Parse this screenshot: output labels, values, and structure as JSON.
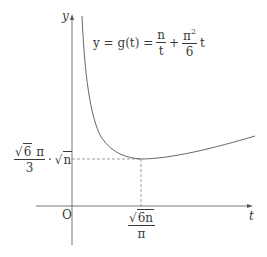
{
  "diagram": {
    "type": "function-graph",
    "axes": {
      "x_label": "t",
      "y_label": "y",
      "origin_label": "O"
    },
    "formula": {
      "lhs": "y = g(t) =",
      "term1_num": "n",
      "term1_den": "t",
      "plus": "+",
      "term2_num": "π",
      "term2_num_exp": "2",
      "term2_den": "6",
      "term2_var": "t"
    },
    "minimum_point": {
      "x_label_sqrt": "6n",
      "x_label_den": "π",
      "y_label_coef_sqrt": "6",
      "y_label_coef_pi": "π",
      "y_label_coef_den": "3",
      "y_label_dot": "·",
      "y_label_sqrt": "n"
    },
    "colors": {
      "curve": "#555555",
      "axes": "#555555",
      "dashed": "#777777",
      "text": "#3a3a3a"
    }
  }
}
